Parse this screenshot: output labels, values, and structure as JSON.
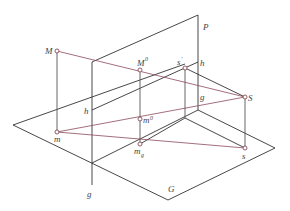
{
  "diagram": {
    "type": "descriptive-geometry-projection",
    "planes": [
      {
        "id": "P",
        "label": "P",
        "kind": "vertical picture plane"
      },
      {
        "id": "G",
        "label": "G",
        "kind": "ground plane"
      }
    ],
    "lines": [
      {
        "id": "h",
        "label": "h",
        "kind": "horizon line on P"
      },
      {
        "id": "g",
        "label": "g",
        "kind": "ground line (trace of G on P)"
      }
    ],
    "points": [
      {
        "id": "M",
        "label": "M"
      },
      {
        "id": "M0",
        "label": "M",
        "sup": "0"
      },
      {
        "id": "m",
        "label": "m"
      },
      {
        "id": "m0",
        "label": "m",
        "sup": "0"
      },
      {
        "id": "mg",
        "label": "m",
        "sub": "g"
      },
      {
        "id": "S",
        "label": "S"
      },
      {
        "id": "s",
        "label": "s"
      },
      {
        "id": "sp",
        "label": "s",
        "sup": "′"
      }
    ],
    "colors": {
      "edge": "#333333",
      "projection": "#8a4a5a",
      "point_fill": "#ffffff",
      "label": "#444444"
    }
  }
}
